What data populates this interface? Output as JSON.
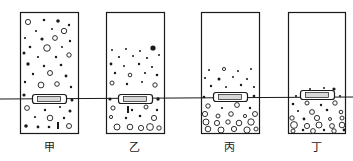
{
  "figure": {
    "type": "physics-sedimentation-diagram",
    "width": 353,
    "height": 161,
    "background_color": "#ffffff",
    "ink_color": "#1a1a1a",
    "liquid_level_line": {
      "name": "common-liquid-level-line",
      "y_left": 99,
      "y_right": 97,
      "x_start": 0,
      "x_end": 353,
      "stroke_width": 1
    },
    "containers": [
      {
        "id": "jia",
        "label": "甲",
        "label_x": 49,
        "label_y": 141,
        "rect": {
          "x": 20,
          "y": 12,
          "w": 58,
          "h": 121
        },
        "state": "uniformly-suspended",
        "float_block": {
          "x": 32,
          "y": 94,
          "w": 34,
          "h": 9
        },
        "particles": [
          {
            "cx": 28,
            "cy": 22,
            "r": 2.6,
            "fill": "none"
          },
          {
            "cx": 44,
            "cy": 20,
            "r": 1.3,
            "fill": "solid"
          },
          {
            "cx": 58,
            "cy": 21,
            "r": 1.8,
            "fill": "solid"
          },
          {
            "cx": 69,
            "cy": 25,
            "r": 1.2,
            "fill": "solid"
          },
          {
            "cx": 36,
            "cy": 31,
            "r": 1.1,
            "fill": "solid"
          },
          {
            "cx": 52,
            "cy": 29,
            "r": 1.0,
            "fill": "solid"
          },
          {
            "cx": 64,
            "cy": 31,
            "r": 2.7,
            "fill": "none"
          },
          {
            "cx": 25,
            "cy": 38,
            "r": 1.1,
            "fill": "solid"
          },
          {
            "cx": 42,
            "cy": 39,
            "r": 1.6,
            "fill": "solid"
          },
          {
            "cx": 55,
            "cy": 38,
            "r": 2.4,
            "fill": "none"
          },
          {
            "cx": 70,
            "cy": 41,
            "r": 1.2,
            "fill": "solid"
          },
          {
            "cx": 30,
            "cy": 47,
            "r": 1.3,
            "fill": "solid"
          },
          {
            "cx": 47,
            "cy": 48,
            "r": 3.3,
            "fill": "none"
          },
          {
            "cx": 62,
            "cy": 47,
            "r": 1.0,
            "fill": "solid"
          },
          {
            "cx": 24,
            "cy": 53,
            "r": 1.5,
            "fill": "solid"
          },
          {
            "cx": 38,
            "cy": 57,
            "r": 1.1,
            "fill": "solid"
          },
          {
            "cx": 56,
            "cy": 57,
            "r": 1.2,
            "fill": "solid"
          },
          {
            "cx": 69,
            "cy": 55,
            "r": 2.2,
            "fill": "none"
          },
          {
            "cx": 28,
            "cy": 64,
            "r": 1.7,
            "fill": "solid"
          },
          {
            "cx": 44,
            "cy": 66,
            "r": 1.2,
            "fill": "solid"
          },
          {
            "cx": 61,
            "cy": 65,
            "r": 1.3,
            "fill": "solid"
          },
          {
            "cx": 33,
            "cy": 74,
            "r": 1.2,
            "fill": "solid"
          },
          {
            "cx": 50,
            "cy": 73,
            "r": 2.5,
            "fill": "none"
          },
          {
            "cx": 66,
            "cy": 76,
            "r": 1.4,
            "fill": "solid"
          },
          {
            "cx": 25,
            "cy": 82,
            "r": 1.2,
            "fill": "solid"
          },
          {
            "cx": 41,
            "cy": 85,
            "r": 2.9,
            "fill": "none"
          },
          {
            "cx": 57,
            "cy": 84,
            "r": 2.3,
            "fill": "none"
          },
          {
            "cx": 71,
            "cy": 87,
            "r": 1.2,
            "fill": "solid"
          },
          {
            "cx": 24,
            "cy": 95,
            "r": 1.6,
            "fill": "solid"
          },
          {
            "cx": 72,
            "cy": 100,
            "r": 1.5,
            "fill": "solid"
          },
          {
            "cx": 27,
            "cy": 108,
            "r": 2.4,
            "fill": "none"
          },
          {
            "cx": 45,
            "cy": 110,
            "r": 1.2,
            "fill": "solid"
          },
          {
            "cx": 60,
            "cy": 107,
            "r": 1.1,
            "fill": "solid"
          },
          {
            "cx": 70,
            "cy": 111,
            "r": 1.5,
            "fill": "solid"
          },
          {
            "cx": 35,
            "cy": 117,
            "r": 1.1,
            "fill": "solid"
          },
          {
            "cx": 50,
            "cy": 118,
            "r": 2.8,
            "fill": "none"
          },
          {
            "cx": 64,
            "cy": 118,
            "r": 1.2,
            "fill": "solid"
          },
          {
            "cx": 26,
            "cy": 126,
            "r": 1.8,
            "fill": "solid"
          },
          {
            "cx": 38,
            "cy": 127,
            "r": 1.4,
            "fill": "solid"
          },
          {
            "cx": 49,
            "cy": 127,
            "r": 1.3,
            "fill": "solid"
          },
          {
            "cx": 69,
            "cy": 126,
            "r": 2.5,
            "fill": "none"
          }
        ],
        "bars": [
          {
            "x": 57,
            "y": 122,
            "w": 2,
            "h": 7
          }
        ]
      },
      {
        "id": "yi",
        "label": "乙",
        "label_x": 134,
        "label_y": 141,
        "rect": {
          "x": 106,
          "y": 12,
          "w": 58,
          "h": 121
        },
        "state": "partially-settled",
        "float_block": {
          "x": 118,
          "y": 94,
          "w": 34,
          "h": 9
        },
        "particles": [
          {
            "cx": 112,
            "cy": 50,
            "r": 1.0,
            "fill": "solid"
          },
          {
            "cx": 126,
            "cy": 49,
            "r": 1.0,
            "fill": "solid"
          },
          {
            "cx": 140,
            "cy": 51,
            "r": 1.0,
            "fill": "solid"
          },
          {
            "cx": 153,
            "cy": 48,
            "r": 2.6,
            "fill": "solid"
          },
          {
            "cx": 119,
            "cy": 57,
            "r": 1.1,
            "fill": "solid"
          },
          {
            "cx": 133,
            "cy": 56,
            "r": 1.0,
            "fill": "solid"
          },
          {
            "cx": 147,
            "cy": 58,
            "r": 1.1,
            "fill": "solid"
          },
          {
            "cx": 159,
            "cy": 55,
            "r": 1.0,
            "fill": "solid"
          },
          {
            "cx": 111,
            "cy": 64,
            "r": 1.4,
            "fill": "solid"
          },
          {
            "cx": 124,
            "cy": 66,
            "r": 1.0,
            "fill": "solid"
          },
          {
            "cx": 139,
            "cy": 64,
            "r": 1.2,
            "fill": "solid"
          },
          {
            "cx": 152,
            "cy": 67,
            "r": 1.1,
            "fill": "solid"
          },
          {
            "cx": 115,
            "cy": 73,
            "r": 1.2,
            "fill": "solid"
          },
          {
            "cx": 130,
            "cy": 75,
            "r": 1.8,
            "fill": "none"
          },
          {
            "cx": 145,
            "cy": 73,
            "r": 1.1,
            "fill": "solid"
          },
          {
            "cx": 157,
            "cy": 75,
            "r": 1.3,
            "fill": "solid"
          },
          {
            "cx": 112,
            "cy": 83,
            "r": 2.0,
            "fill": "none"
          },
          {
            "cx": 127,
            "cy": 84,
            "r": 1.2,
            "fill": "solid"
          },
          {
            "cx": 142,
            "cy": 82,
            "r": 1.0,
            "fill": "solid"
          },
          {
            "cx": 155,
            "cy": 85,
            "r": 2.2,
            "fill": "none"
          },
          {
            "cx": 110,
            "cy": 99,
            "r": 1.6,
            "fill": "solid"
          },
          {
            "cx": 158,
            "cy": 99,
            "r": 1.7,
            "fill": "solid"
          },
          {
            "cx": 113,
            "cy": 108,
            "r": 2.1,
            "fill": "none"
          },
          {
            "cx": 132,
            "cy": 110,
            "r": 1.2,
            "fill": "solid"
          },
          {
            "cx": 146,
            "cy": 107,
            "r": 2.0,
            "fill": "none"
          },
          {
            "cx": 157,
            "cy": 110,
            "r": 1.2,
            "fill": "solid"
          },
          {
            "cx": 111,
            "cy": 117,
            "r": 1.6,
            "fill": "none"
          },
          {
            "cx": 126,
            "cy": 118,
            "r": 1.2,
            "fill": "solid"
          },
          {
            "cx": 140,
            "cy": 116,
            "r": 1.3,
            "fill": "solid"
          },
          {
            "cx": 154,
            "cy": 118,
            "r": 2.6,
            "fill": "none"
          },
          {
            "cx": 117,
            "cy": 127,
            "r": 3.0,
            "fill": "none"
          },
          {
            "cx": 130,
            "cy": 127,
            "r": 2.8,
            "fill": "none"
          },
          {
            "cx": 141,
            "cy": 128,
            "r": 2.6,
            "fill": "none"
          },
          {
            "cx": 150,
            "cy": 127,
            "r": 3.4,
            "fill": "none"
          },
          {
            "cx": 159,
            "cy": 128,
            "r": 2.2,
            "fill": "none"
          }
        ],
        "bars": [
          {
            "x": 127,
            "y": 106,
            "w": 2,
            "h": 7
          }
        ]
      },
      {
        "id": "bing",
        "label": "丙",
        "label_x": 229,
        "label_y": 141,
        "rect": {
          "x": 201,
          "y": 12,
          "w": 58,
          "h": 121
        },
        "state": "mostly-settled",
        "float_block": {
          "x": 213,
          "y": 92,
          "w": 34,
          "h": 9
        },
        "particles": [
          {
            "cx": 209,
            "cy": 70,
            "r": 1.0,
            "fill": "solid"
          },
          {
            "cx": 224,
            "cy": 69,
            "r": 1.6,
            "fill": "none"
          },
          {
            "cx": 238,
            "cy": 71,
            "r": 1.0,
            "fill": "solid"
          },
          {
            "cx": 251,
            "cy": 69,
            "r": 1.0,
            "fill": "solid"
          },
          {
            "cx": 205,
            "cy": 78,
            "r": 1.1,
            "fill": "solid"
          },
          {
            "cx": 219,
            "cy": 79,
            "r": 1.5,
            "fill": "solid"
          },
          {
            "cx": 233,
            "cy": 77,
            "r": 1.0,
            "fill": "solid"
          },
          {
            "cx": 247,
            "cy": 79,
            "r": 1.1,
            "fill": "solid"
          },
          {
            "cx": 211,
            "cy": 86,
            "r": 1.2,
            "fill": "solid"
          },
          {
            "cx": 226,
            "cy": 87,
            "r": 1.0,
            "fill": "solid"
          },
          {
            "cx": 241,
            "cy": 85,
            "r": 1.2,
            "fill": "solid"
          },
          {
            "cx": 254,
            "cy": 87,
            "r": 1.1,
            "fill": "solid"
          },
          {
            "cx": 204,
            "cy": 97,
            "r": 1.3,
            "fill": "solid"
          },
          {
            "cx": 254,
            "cy": 96,
            "r": 1.3,
            "fill": "solid"
          },
          {
            "cx": 208,
            "cy": 106,
            "r": 2.2,
            "fill": "none"
          },
          {
            "cx": 222,
            "cy": 108,
            "r": 1.1,
            "fill": "solid"
          },
          {
            "cx": 237,
            "cy": 105,
            "r": 2.4,
            "fill": "none"
          },
          {
            "cx": 250,
            "cy": 108,
            "r": 1.2,
            "fill": "solid"
          },
          {
            "cx": 205,
            "cy": 114,
            "r": 2.6,
            "fill": "none"
          },
          {
            "cx": 218,
            "cy": 116,
            "r": 2.0,
            "fill": "none"
          },
          {
            "cx": 231,
            "cy": 114,
            "r": 2.3,
            "fill": "none"
          },
          {
            "cx": 245,
            "cy": 116,
            "r": 1.6,
            "fill": "none"
          },
          {
            "cx": 255,
            "cy": 114,
            "r": 2.5,
            "fill": "none"
          },
          {
            "cx": 206,
            "cy": 122,
            "r": 3.0,
            "fill": "none"
          },
          {
            "cx": 217,
            "cy": 123,
            "r": 2.6,
            "fill": "none"
          },
          {
            "cx": 228,
            "cy": 122,
            "r": 2.2,
            "fill": "none"
          },
          {
            "cx": 239,
            "cy": 123,
            "r": 2.8,
            "fill": "none"
          },
          {
            "cx": 251,
            "cy": 122,
            "r": 3.2,
            "fill": "none"
          },
          {
            "cx": 208,
            "cy": 129,
            "r": 2.8,
            "fill": "none"
          },
          {
            "cx": 221,
            "cy": 130,
            "r": 3.0,
            "fill": "none"
          },
          {
            "cx": 234,
            "cy": 129,
            "r": 2.6,
            "fill": "none"
          },
          {
            "cx": 247,
            "cy": 130,
            "r": 3.1,
            "fill": "none"
          },
          {
            "cx": 256,
            "cy": 129,
            "r": 2.0,
            "fill": "none"
          }
        ],
        "bars": []
      },
      {
        "id": "ding",
        "label": "丁",
        "label_x": 316,
        "label_y": 141,
        "rect": {
          "x": 288,
          "y": 12,
          "w": 57,
          "h": 121
        },
        "state": "fully-settled",
        "float_block": {
          "x": 300,
          "y": 90,
          "w": 34,
          "h": 9
        },
        "particles": [
          {
            "cx": 310,
            "cy": 89,
            "r": 1.0,
            "fill": "solid"
          },
          {
            "cx": 324,
            "cy": 88,
            "r": 1.0,
            "fill": "solid"
          },
          {
            "cx": 334,
            "cy": 89,
            "r": 1.6,
            "fill": "solid"
          },
          {
            "cx": 296,
            "cy": 96,
            "r": 1.1,
            "fill": "solid"
          },
          {
            "cx": 318,
            "cy": 96,
            "r": 1.0,
            "fill": "solid"
          },
          {
            "cx": 340,
            "cy": 96,
            "r": 1.1,
            "fill": "solid"
          },
          {
            "cx": 293,
            "cy": 104,
            "r": 1.3,
            "fill": "solid"
          },
          {
            "cx": 307,
            "cy": 103,
            "r": 2.0,
            "fill": "none"
          },
          {
            "cx": 321,
            "cy": 105,
            "r": 1.2,
            "fill": "solid"
          },
          {
            "cx": 335,
            "cy": 103,
            "r": 2.2,
            "fill": "none"
          },
          {
            "cx": 298,
            "cy": 111,
            "r": 1.1,
            "fill": "solid"
          },
          {
            "cx": 312,
            "cy": 112,
            "r": 2.4,
            "fill": "none"
          },
          {
            "cx": 327,
            "cy": 110,
            "r": 1.3,
            "fill": "solid"
          },
          {
            "cx": 341,
            "cy": 112,
            "r": 1.8,
            "fill": "none"
          },
          {
            "cx": 292,
            "cy": 118,
            "r": 2.2,
            "fill": "none"
          },
          {
            "cx": 304,
            "cy": 119,
            "r": 1.4,
            "fill": "solid"
          },
          {
            "cx": 317,
            "cy": 118,
            "r": 2.6,
            "fill": "none"
          },
          {
            "cx": 330,
            "cy": 119,
            "r": 1.5,
            "fill": "none"
          },
          {
            "cx": 342,
            "cy": 118,
            "r": 2.0,
            "fill": "none"
          },
          {
            "cx": 294,
            "cy": 125,
            "r": 3.4,
            "fill": "none"
          },
          {
            "cx": 307,
            "cy": 126,
            "r": 2.6,
            "fill": "none"
          },
          {
            "cx": 319,
            "cy": 125,
            "r": 3.0,
            "fill": "none"
          },
          {
            "cx": 332,
            "cy": 126,
            "r": 2.4,
            "fill": "none"
          },
          {
            "cx": 342,
            "cy": 125,
            "r": 2.8,
            "fill": "none"
          },
          {
            "cx": 293,
            "cy": 131,
            "r": 2.0,
            "fill": "none"
          },
          {
            "cx": 303,
            "cy": 130,
            "r": 1.3,
            "fill": "solid"
          },
          {
            "cx": 313,
            "cy": 131,
            "r": 2.4,
            "fill": "none"
          },
          {
            "cx": 324,
            "cy": 130,
            "r": 1.2,
            "fill": "solid"
          },
          {
            "cx": 334,
            "cy": 131,
            "r": 2.2,
            "fill": "none"
          },
          {
            "cx": 344,
            "cy": 130,
            "r": 1.4,
            "fill": "solid"
          }
        ],
        "bars": []
      }
    ]
  }
}
